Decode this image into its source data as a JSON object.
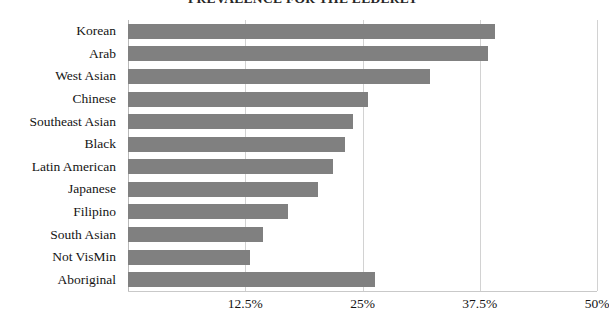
{
  "chart_data": {
    "type": "bar",
    "orientation": "horizontal",
    "title": "PREVALENCE FOR THE ELDERLY",
    "xlabel": "",
    "ylabel": "",
    "xlim": [
      0,
      50
    ],
    "xticks": [
      "12.5%",
      "25%",
      "37.5%",
      "50%"
    ],
    "xtick_values": [
      12.5,
      25,
      37.5,
      50
    ],
    "grid": true,
    "legend": false,
    "bar_color": "#808080",
    "categories": [
      "Korean",
      "Arab",
      "West Asian",
      "Chinese",
      "Southeast Asian",
      "Black",
      "Latin American",
      "Japanese",
      "Filipino",
      "South Asian",
      "Not VisMin",
      "Aboriginal"
    ],
    "values": [
      39.1,
      38.4,
      32.2,
      25.6,
      24.0,
      23.1,
      21.9,
      20.3,
      17.1,
      14.4,
      13.0,
      26.3
    ]
  },
  "axis": {
    "tick_0": "12.5%",
    "tick_1": "25%",
    "tick_2": "37.5%",
    "tick_3": "50%"
  },
  "categories": {
    "c0": "Korean",
    "c1": "Arab",
    "c2": "West Asian",
    "c3": "Chinese",
    "c4": "Southeast Asian",
    "c5": "Black",
    "c6": "Latin American",
    "c7": "Japanese",
    "c8": "Filipino",
    "c9": "South Asian",
    "c10": "Not VisMin",
    "c11": "Aboriginal"
  }
}
